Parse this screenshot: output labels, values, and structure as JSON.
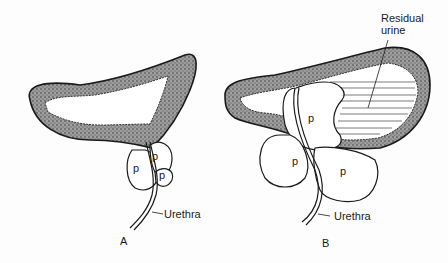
{
  "figure": {
    "panel_a": {
      "caption": "A",
      "prostate_lobe_labels": [
        "p",
        "p",
        "p"
      ],
      "urethra_label": "Urethra"
    },
    "panel_b": {
      "caption": "B",
      "prostate_lobe_labels": [
        "p",
        "p",
        "p"
      ],
      "urethra_label": "Urethra",
      "residual_label_line1": "Residual",
      "residual_label_line2": "urine"
    },
    "colors": {
      "wall_fill": "#8a8a8a",
      "outline": "#1a1a1a",
      "background": "#fdfdfd"
    }
  }
}
